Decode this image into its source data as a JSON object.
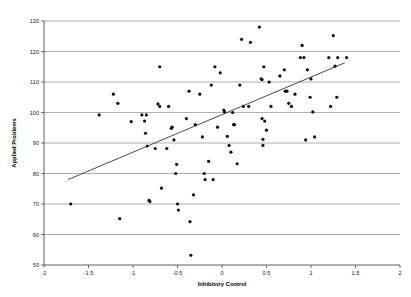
{
  "chart_data": {
    "type": "scatter",
    "title": "",
    "xlabel": "Inhibitory Control",
    "ylabel": "Applied Problems",
    "xlim": [
      -2,
      2
    ],
    "ylim": [
      50,
      130
    ],
    "xticks": [
      -2,
      -1.5,
      -1,
      -0.5,
      0,
      0.5,
      1,
      1.5,
      2
    ],
    "xtick_labels": [
      "-2",
      "-1.5",
      "-1",
      "-0.5",
      "0",
      "0.5",
      "1",
      "1.5",
      "2"
    ],
    "yticks": [
      50,
      60,
      70,
      80,
      90,
      100,
      110,
      120,
      130
    ],
    "ytick_labels": [
      "50",
      "60",
      "70",
      "80",
      "90",
      "100",
      "110",
      "120",
      "130"
    ],
    "grid": "horizontal",
    "legend": null,
    "marker": "filled-circle",
    "marker_color": "#0d0d0d",
    "gridline_color": "#9a9a9a",
    "axis_color": "#4d4d4d",
    "trend_line": {
      "visible": true,
      "color": "#2b2b2b",
      "x_start": -1.73,
      "y_start": 78.0,
      "x_end": 1.38,
      "y_end": 116.3
    },
    "points": [
      [
        -1.7,
        70.0
      ],
      [
        -1.38,
        99.2
      ],
      [
        -1.22,
        106.0
      ],
      [
        -1.17,
        103.0
      ],
      [
        -1.15,
        65.2
      ],
      [
        -1.02,
        97.0
      ],
      [
        -0.9,
        99.2
      ],
      [
        -0.87,
        97.2
      ],
      [
        -0.86,
        93.2
      ],
      [
        -0.85,
        99.2
      ],
      [
        -0.84,
        89.0
      ],
      [
        -0.82,
        71.2
      ],
      [
        -0.81,
        70.8
      ],
      [
        -0.75,
        88.2
      ],
      [
        -0.72,
        102.8
      ],
      [
        -0.7,
        115.0
      ],
      [
        -0.7,
        102.0
      ],
      [
        -0.68,
        75.2
      ],
      [
        -0.62,
        88.2
      ],
      [
        -0.6,
        102.0
      ],
      [
        -0.57,
        94.8
      ],
      [
        -0.56,
        95.2
      ],
      [
        -0.54,
        91.0
      ],
      [
        -0.52,
        80.0
      ],
      [
        -0.51,
        83.0
      ],
      [
        -0.5,
        70.0
      ],
      [
        -0.49,
        68.0
      ],
      [
        -0.4,
        98.0
      ],
      [
        -0.37,
        107.0
      ],
      [
        -0.36,
        64.2
      ],
      [
        -0.35,
        53.2
      ],
      [
        -0.32,
        73.0
      ],
      [
        -0.3,
        96.0
      ],
      [
        -0.25,
        106.0
      ],
      [
        -0.22,
        92.0
      ],
      [
        -0.2,
        80.0
      ],
      [
        -0.19,
        78.0
      ],
      [
        -0.15,
        84.0
      ],
      [
        -0.12,
        109.0
      ],
      [
        -0.1,
        78.0
      ],
      [
        -0.08,
        115.0
      ],
      [
        -0.05,
        95.2
      ],
      [
        -0.02,
        113.0
      ],
      [
        0.02,
        100.8
      ],
      [
        0.03,
        100.2
      ],
      [
        0.06,
        92.2
      ],
      [
        0.08,
        89.2
      ],
      [
        0.1,
        87.0
      ],
      [
        0.12,
        100.0
      ],
      [
        0.13,
        96.0
      ],
      [
        0.14,
        96.0
      ],
      [
        0.17,
        83.2
      ],
      [
        0.2,
        109.0
      ],
      [
        0.22,
        124.0
      ],
      [
        0.24,
        102.0
      ],
      [
        0.3,
        102.0
      ],
      [
        0.32,
        123.0
      ],
      [
        0.42,
        128.0
      ],
      [
        0.44,
        111.0
      ],
      [
        0.45,
        110.8
      ],
      [
        0.45,
        98.0
      ],
      [
        0.46,
        91.2
      ],
      [
        0.46,
        89.2
      ],
      [
        0.47,
        115.0
      ],
      [
        0.48,
        97.2
      ],
      [
        0.5,
        94.2
      ],
      [
        0.53,
        110.0
      ],
      [
        0.55,
        102.0
      ],
      [
        0.65,
        112.0
      ],
      [
        0.7,
        114.0
      ],
      [
        0.71,
        107.0
      ],
      [
        0.73,
        107.0
      ],
      [
        0.75,
        103.0
      ],
      [
        0.78,
        102.0
      ],
      [
        0.82,
        106.0
      ],
      [
        0.88,
        118.0
      ],
      [
        0.9,
        122.0
      ],
      [
        0.92,
        118.0
      ],
      [
        0.94,
        91.0
      ],
      [
        0.96,
        114.0
      ],
      [
        0.99,
        105.0
      ],
      [
        1.0,
        111.0
      ],
      [
        1.02,
        100.2
      ],
      [
        1.04,
        92.0
      ],
      [
        1.2,
        118.0
      ],
      [
        1.22,
        102.0
      ],
      [
        1.25,
        125.2
      ],
      [
        1.27,
        115.2
      ],
      [
        1.29,
        105.0
      ],
      [
        1.3,
        118.0
      ],
      [
        1.4,
        118.0
      ]
    ]
  }
}
